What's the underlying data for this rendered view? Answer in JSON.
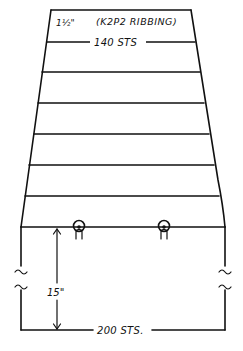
{
  "diagram": {
    "type": "knitting-schematic",
    "colors": {
      "ink": "#111111",
      "background": "#ffffff"
    },
    "top_section": {
      "ribbing_height_label": "1½\"",
      "ribbing_label": "(K2P2 RIBBING)",
      "top_stitch_count_label": "140 STS"
    },
    "tapered_section": {
      "band_count": 6,
      "shape": "trapezoid"
    },
    "bottom_section": {
      "height_label": "15\"",
      "bottom_stitch_count_label": "200 STS.",
      "break_marks": "~ ~"
    },
    "buttons": [
      {
        "label": "button-loop-left"
      },
      {
        "label": "button-loop-right"
      }
    ]
  }
}
